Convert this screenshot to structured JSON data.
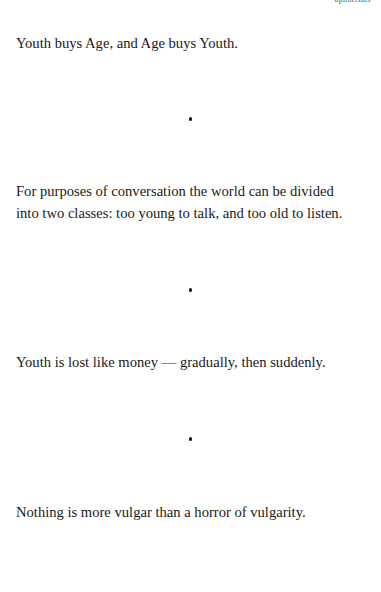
{
  "page": {
    "background_color": "#ffffff",
    "text_color": "#1a1a1a",
    "running_head": "aphorisms"
  },
  "separator": {
    "glyph": "bullet-dot",
    "color": "#151515"
  },
  "aphorisms": [
    {
      "id": "youth-buys-age",
      "text": "Youth buys Age, and Age buys Youth."
    },
    {
      "id": "two-classes",
      "text": "For purposes of conversation the world can be divided\ninto two classes: too young to talk, and too old to listen."
    },
    {
      "id": "youth-lost-like-money",
      "text": "Youth is lost like money — gradually, then suddenly."
    },
    {
      "id": "horror-of-vulgarity",
      "text": "Nothing is more vulgar than a horror of vulgarity."
    }
  ]
}
